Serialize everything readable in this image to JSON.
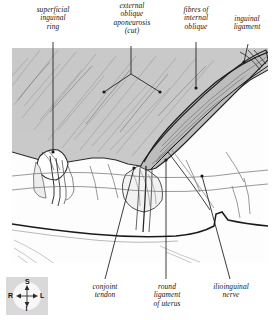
{
  "figure": {
    "background_color": "#ffffff",
    "aponeurosis_fill": "#c8c8c8",
    "muscle_fill": "#b4b4b4",
    "ink_color": "#1a1a1a"
  },
  "labels": {
    "top": [
      {
        "id": "superficial-inguinal-ring",
        "text": "superficial\ninguinal\nring",
        "x": 22,
        "y": 6,
        "width": 62
      },
      {
        "id": "external-oblique-aponeurosis",
        "text": "external\noblique\naponeurosis\n(cut)",
        "x": 96,
        "y": 2,
        "width": 72
      },
      {
        "id": "fibres-of-internal-oblique",
        "text": "fibres of\ninternal\noblique",
        "x": 172,
        "y": 6,
        "width": 48
      },
      {
        "id": "inguinal-ligament",
        "text": "inguinal\nligament",
        "x": 222,
        "y": 15,
        "width": 52
      }
    ],
    "bottom": [
      {
        "id": "conjoint-tendon",
        "text": "conjoint\ntendon",
        "x": 78,
        "y": 283,
        "width": 54
      },
      {
        "id": "round-ligament-of-uterus",
        "text": "round\nligament\nof uterus",
        "x": 138,
        "y": 283,
        "width": 58
      },
      {
        "id": "ilioinguinal-nerve",
        "text": "ilioinguinal\nnerve",
        "x": 200,
        "y": 283,
        "width": 62
      }
    ]
  },
  "compass": {
    "name": "orientation-compass",
    "superior": "S",
    "inferior": "I",
    "right": "R",
    "left": "L",
    "box_color": "#d9d9d9",
    "disc_color": "#f7f7f7"
  }
}
